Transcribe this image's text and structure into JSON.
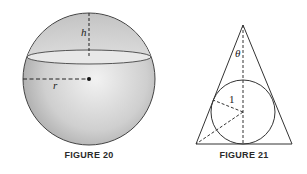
{
  "figures": [
    {
      "caption": "FIGURE 20",
      "shape": "sphere with horizontal cutting plane",
      "labels": {
        "height": "h",
        "radius": "r"
      }
    },
    {
      "caption": "FIGURE 21",
      "shape": "isosceles triangle with inscribed circle",
      "labels": {
        "angle": "θ",
        "radius": "1"
      }
    }
  ],
  "colors": {
    "sphere_fill_light": "#f0f0f0",
    "sphere_fill_dark": "#a8a8a8",
    "stroke": "#333333"
  }
}
